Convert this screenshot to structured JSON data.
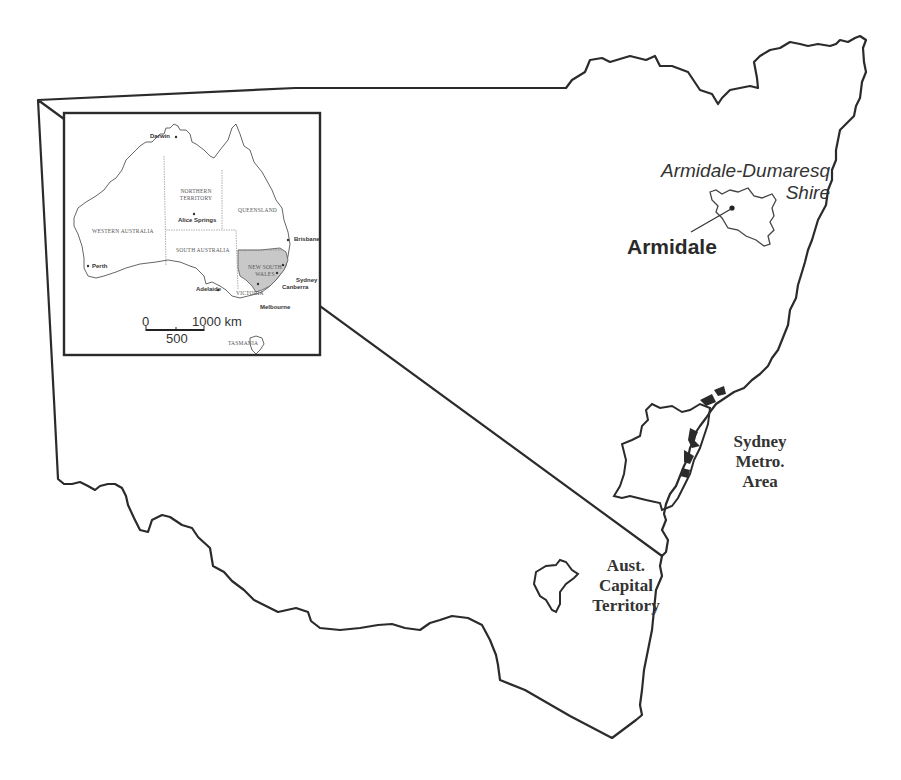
{
  "map": {
    "region": "New South Wales",
    "labels": {
      "shire": [
        "Armidale-Dumaresq",
        "Shire"
      ],
      "town": "Armidale",
      "sydney": [
        "Sydney",
        "Metro.",
        "Area"
      ],
      "act": [
        "Aust.",
        "Capital",
        "Territory"
      ]
    }
  },
  "inset": {
    "states": {
      "wa": "WESTERN AUSTRALIA",
      "nt": [
        "NORTHERN",
        "TERRITORY"
      ],
      "qld": "QUEENSLAND",
      "sa": "SOUTH AUSTRALIA",
      "nsw": [
        "NEW SOUTH",
        "WALES"
      ],
      "vic": "VICTORIA",
      "tas": "TASMANIA"
    },
    "cities": {
      "darwin": "Darwin",
      "alice": "Alice Springs",
      "brisbane": "Brisbane",
      "perth": "Perth",
      "adelaide": "Adelaide",
      "sydney": "Sydney",
      "canberra": "Canberra",
      "melbourne": "Melbourne"
    },
    "scale": {
      "zero": "0",
      "max": "1000 km",
      "mid": "500"
    },
    "highlight_color": "#c8c8c8"
  }
}
